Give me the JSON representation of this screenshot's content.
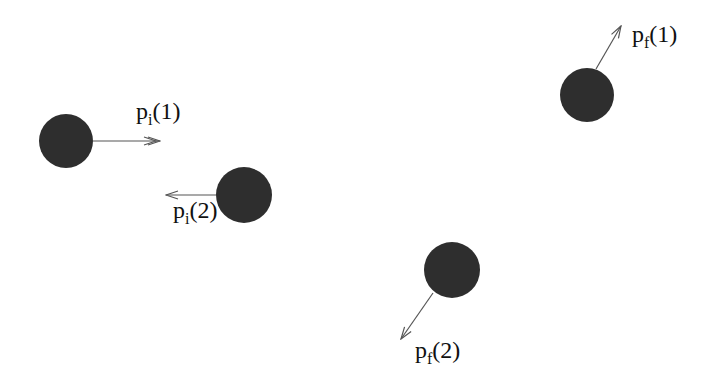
{
  "diagram": {
    "type": "two-particle collision (initial and final momenta)",
    "colors": {
      "particle": "#2e2e2e",
      "arrow": "#555555",
      "background": "#ffffff"
    },
    "particles": [
      {
        "id": "initial-1",
        "cx": 66,
        "cy": 141,
        "r": 27
      },
      {
        "id": "initial-2",
        "cx": 244,
        "cy": 195,
        "r": 28
      },
      {
        "id": "final-1",
        "cx": 587,
        "cy": 95,
        "r": 27
      },
      {
        "id": "final-2",
        "cx": 452,
        "cy": 270,
        "r": 28
      }
    ],
    "arrows": [
      {
        "id": "pi1",
        "x1": 93,
        "y1": 141,
        "x2": 160,
        "y2": 141
      },
      {
        "id": "pi2",
        "x1": 216,
        "y1": 195,
        "x2": 166,
        "y2": 195
      },
      {
        "id": "pf1",
        "x1": 596,
        "y1": 69,
        "x2": 621,
        "y2": 26
      },
      {
        "id": "pf2",
        "x1": 433,
        "y1": 293,
        "x2": 401,
        "y2": 339
      }
    ],
    "labels": {
      "pi1": {
        "base": "p",
        "sub": "i",
        "arg": "(1)"
      },
      "pi2": {
        "base": "p",
        "sub": "i",
        "arg": "(2)"
      },
      "pf1": {
        "base": "p",
        "sub": "f",
        "arg": "(1)"
      },
      "pf2": {
        "base": "p",
        "sub": "f",
        "arg": "(2)"
      }
    }
  }
}
